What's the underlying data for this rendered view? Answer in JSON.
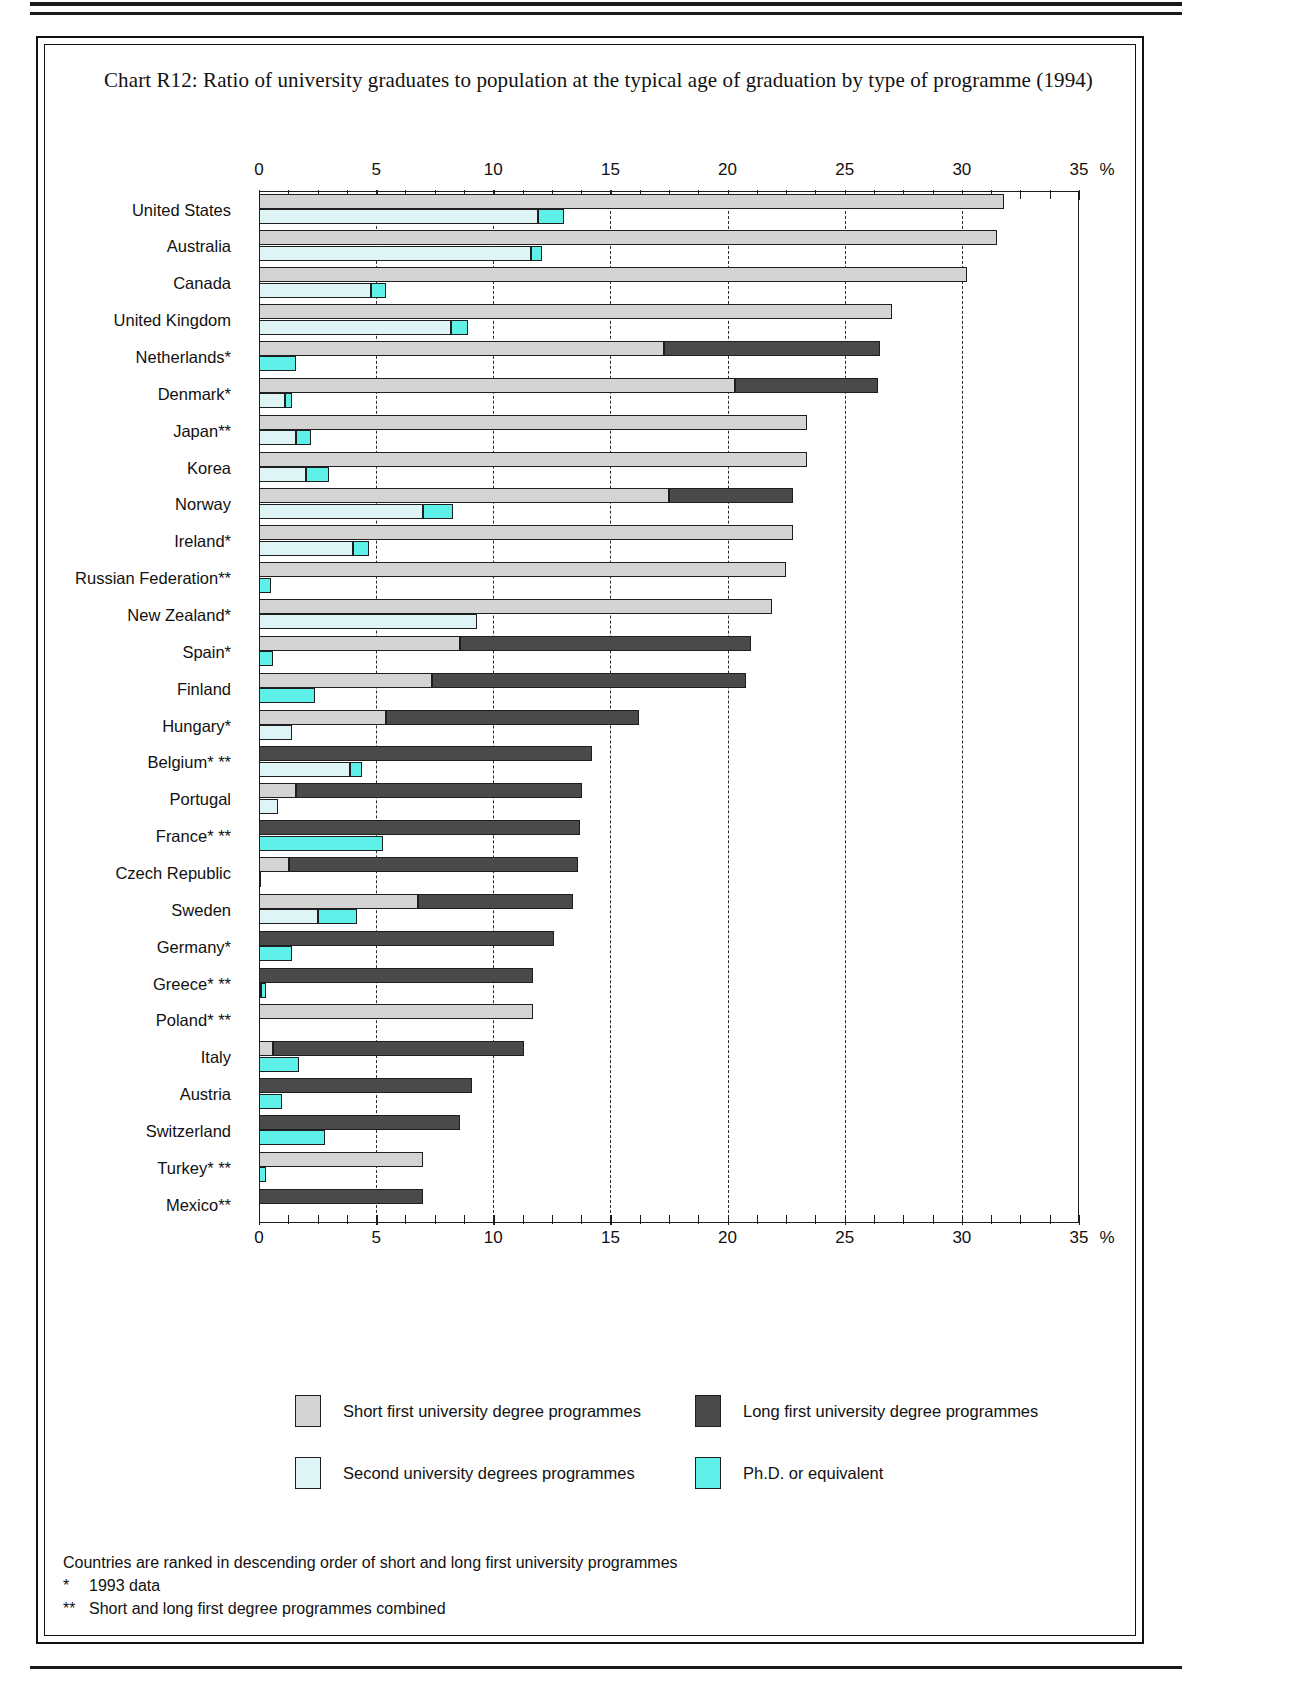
{
  "title": "Chart R12: Ratio of university graduates to population at the typical age of graduation by type of programme (1994)",
  "axis": {
    "unit_symbol": "%",
    "ticks": [
      "0",
      "5",
      "10",
      "15",
      "20",
      "25",
      "30",
      "35"
    ]
  },
  "legend": [
    {
      "key": "short",
      "label": "Short first university degree programmes",
      "color": "#d4d4d4"
    },
    {
      "key": "long",
      "label": "Long first university degree programmes",
      "color": "#4a4a4a"
    },
    {
      "key": "second",
      "label": "Second university degrees programmes",
      "color": "#dff5f5"
    },
    {
      "key": "phd",
      "label": "Ph.D. or equivalent",
      "color": "#5ff0ea"
    }
  ],
  "notes": [
    {
      "mark": "",
      "text": "Countries are ranked in descending order of short and  long first university programmes"
    },
    {
      "mark": "*",
      "text": "1993 data"
    },
    {
      "mark": "**",
      "text": "Short and long first degree programmes combined"
    }
  ],
  "chart_data": {
    "type": "bar",
    "title": "Chart R12: Ratio of university graduates to population at the typical age of graduation by type of programme (1994)",
    "orientation": "horizontal",
    "stacked": true,
    "xlabel": "%",
    "ylabel": "",
    "xlim": [
      0,
      35
    ],
    "xticks": [
      0,
      5,
      10,
      15,
      20,
      25,
      30,
      35
    ],
    "grid": "dashed vertical at 5-unit intervals",
    "legend_position": "bottom",
    "series": [
      {
        "name": "Short first university degree programmes",
        "color": "#d4d4d4"
      },
      {
        "name": "Long first university degree programmes",
        "color": "#4a4a4a"
      },
      {
        "name": "Second university degrees programmes",
        "color": "#dff5f5"
      },
      {
        "name": "Ph.D. or equivalent",
        "color": "#5ff0ea"
      }
    ],
    "categories": [
      "United States",
      "Australia",
      "Canada",
      "United Kingdom",
      "Netherlands*",
      "Denmark*",
      "Japan**",
      "Korea",
      "Norway",
      "Ireland*",
      "Russian Federation**",
      "New Zealand*",
      "Spain*",
      "Finland",
      "Hungary*",
      "Belgium* **",
      "Portugal",
      "France* **",
      "Czech Republic",
      "Sweden",
      "Germany*",
      "Greece* **",
      "Poland* **",
      "Italy",
      "Austria",
      "Switzerland",
      "Turkey* **",
      "Mexico**"
    ],
    "rows": [
      {
        "country": "United States",
        "short": 31.8,
        "long": 0.0,
        "second": 11.9,
        "phd": 1.1
      },
      {
        "country": "Australia",
        "short": 31.5,
        "long": 0.0,
        "second": 11.6,
        "phd": 0.5
      },
      {
        "country": "Canada",
        "short": 30.2,
        "long": 0.0,
        "second": 4.8,
        "phd": 0.6
      },
      {
        "country": "United Kingdom",
        "short": 27.0,
        "long": 0.0,
        "second": 8.2,
        "phd": 0.7
      },
      {
        "country": "Netherlands*",
        "short": 17.3,
        "long": 9.2,
        "second": 0.0,
        "phd": 1.6
      },
      {
        "country": "Denmark*",
        "short": 20.3,
        "long": 6.1,
        "second": 1.1,
        "phd": 0.3
      },
      {
        "country": "Japan**",
        "short": 23.4,
        "long": 0.0,
        "second": 1.6,
        "phd": 0.6
      },
      {
        "country": "Korea",
        "short": 23.4,
        "long": 0.0,
        "second": 2.0,
        "phd": 1.0
      },
      {
        "country": "Norway",
        "short": 17.5,
        "long": 5.3,
        "second": 7.0,
        "phd": 1.3
      },
      {
        "country": "Ireland*",
        "short": 22.8,
        "long": 0.0,
        "second": 4.0,
        "phd": 0.7
      },
      {
        "country": "Russian Federation**",
        "short": 22.5,
        "long": 0.0,
        "second": 0.0,
        "phd": 0.5
      },
      {
        "country": "New Zealand*",
        "short": 21.9,
        "long": 0.0,
        "second": 9.3,
        "phd": 0.0
      },
      {
        "country": "Spain*",
        "short": 8.6,
        "long": 12.4,
        "second": 0.0,
        "phd": 0.6
      },
      {
        "country": "Finland",
        "short": 7.4,
        "long": 13.4,
        "second": 0.0,
        "phd": 2.4
      },
      {
        "country": "Hungary*",
        "short": 5.4,
        "long": 10.8,
        "second": 1.4,
        "phd": 0.0
      },
      {
        "country": "Belgium* **",
        "short": 0.0,
        "long": 14.2,
        "second": 3.9,
        "phd": 0.5
      },
      {
        "country": "Portugal",
        "short": 1.6,
        "long": 12.2,
        "second": 0.8,
        "phd": 0.0
      },
      {
        "country": "France* **",
        "short": 0.0,
        "long": 13.7,
        "second": 0.0,
        "phd": 5.3
      },
      {
        "country": "Czech Republic",
        "short": 1.3,
        "long": 12.3,
        "second": 0.1,
        "phd": 0.0
      },
      {
        "country": "Sweden",
        "short": 6.8,
        "long": 6.6,
        "second": 2.5,
        "phd": 1.7
      },
      {
        "country": "Germany*",
        "short": 0.0,
        "long": 12.6,
        "second": 0.0,
        "phd": 1.4
      },
      {
        "country": "Greece* **",
        "short": 0.0,
        "long": 11.7,
        "second": 0.1,
        "phd": 0.2
      },
      {
        "country": "Poland* **",
        "short": 11.7,
        "long": 0.0,
        "second": 0.0,
        "phd": 0.0
      },
      {
        "country": "Italy",
        "short": 0.6,
        "long": 10.7,
        "second": 0.0,
        "phd": 1.7
      },
      {
        "country": "Austria",
        "short": 0.0,
        "long": 9.1,
        "second": 0.0,
        "phd": 1.0
      },
      {
        "country": "Switzerland",
        "short": 0.0,
        "long": 8.6,
        "second": 0.0,
        "phd": 2.8
      },
      {
        "country": "Turkey* **",
        "short": 7.0,
        "long": 0.0,
        "second": 0.0,
        "phd": 0.3
      },
      {
        "country": "Mexico**",
        "short": 0.0,
        "long": 7.0,
        "second": 0.0,
        "phd": 0.0
      }
    ]
  }
}
